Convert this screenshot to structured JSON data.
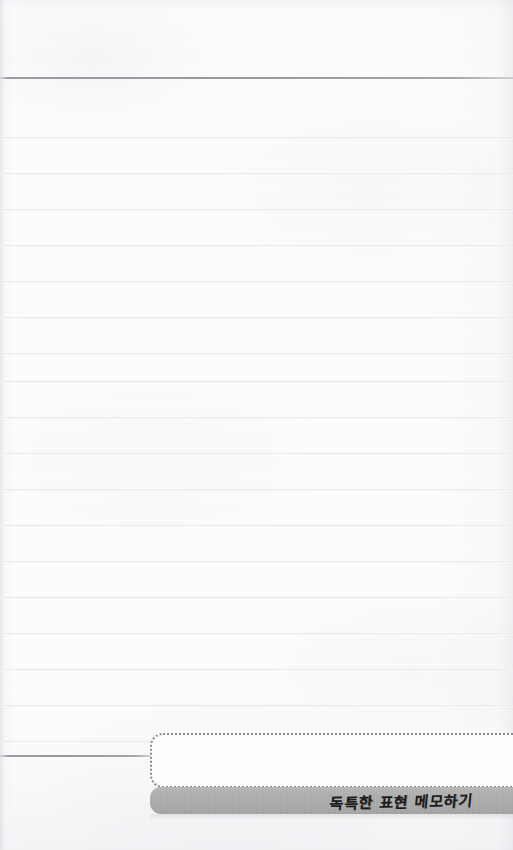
{
  "page": {
    "kind": "lined-notebook-page",
    "width": 513,
    "height": 850,
    "background_color": "#fdfdfe",
    "rule_color_light": "#e9eaec",
    "rule_color_strong": "#9b9da0",
    "line_spacing_px": 36
  },
  "rules": {
    "strong": [
      {
        "name": "top-divider-rule",
        "y": 77
      },
      {
        "name": "bottom-divider-rule",
        "y": 755,
        "width": 152
      }
    ],
    "light_y": [
      137,
      173,
      209,
      245,
      281,
      317,
      353,
      381,
      417,
      453,
      489,
      525,
      561,
      597,
      633,
      669,
      705,
      741
    ]
  },
  "note_box": {
    "name": "memo-dotted-box",
    "x": 150,
    "y": 733,
    "width": 363,
    "height": 55,
    "border_style": "dotted",
    "border_color": "#8b8d90",
    "corner_radius": 13,
    "content": ""
  },
  "label_bar": {
    "name": "memo-label-bar",
    "x": 150,
    "y": 787,
    "width": 363,
    "height": 27,
    "background_color": "#adadad",
    "text": "독특한 표현 메모하기",
    "text_color": "#1b1b1b",
    "style": "handwritten-brush"
  }
}
